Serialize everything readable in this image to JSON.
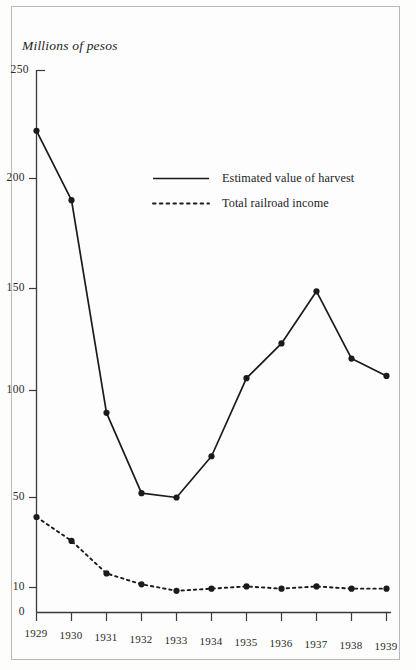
{
  "chart_data": {
    "type": "line",
    "title": "Millions of pesos",
    "xlabel": "",
    "ylabel": "Millions of pesos",
    "x": [
      1929,
      1930,
      1931,
      1932,
      1933,
      1934,
      1935,
      1936,
      1937,
      1938,
      1939
    ],
    "categories": [
      "1929",
      "1930",
      "1931",
      "1932",
      "1933",
      "1934",
      "1935",
      "1936",
      "1937",
      "1938",
      "1939"
    ],
    "series": [
      {
        "name": "Estimated value of harvest",
        "style": "solid",
        "marker": "filled-circle",
        "color": "#1b1b1b",
        "values": [
          222,
          190,
          92,
          55,
          53,
          72,
          108,
          124,
          148,
          117,
          109
        ]
      },
      {
        "name": "Total railroad income",
        "style": "dotted",
        "marker": "filled-circle",
        "color": "#1b1b1b",
        "values": [
          44,
          33,
          18,
          13,
          10,
          11,
          12,
          11,
          12,
          11,
          11
        ]
      }
    ],
    "ylim": [
      0,
      250
    ],
    "yticks": [
      0,
      10,
      50,
      100,
      150,
      200,
      250
    ],
    "ytick_labels": [
      "0",
      "10",
      "50",
      "100",
      "150",
      "200",
      "250"
    ],
    "xticks": [
      1929,
      1930,
      1931,
      1932,
      1933,
      1934,
      1935,
      1936,
      1937,
      1938,
      1939
    ],
    "grid": false,
    "legend_position": "upper-center"
  },
  "legend": {
    "entries": [
      {
        "label": "Estimated value of harvest",
        "style": "solid"
      },
      {
        "label": "Total railroad income",
        "style": "dotted"
      }
    ]
  },
  "colors": {
    "ink": "#1b1b1b",
    "axis": "#3a3a36",
    "page": "#fdfdfd",
    "frame": "#b9b9b6"
  }
}
